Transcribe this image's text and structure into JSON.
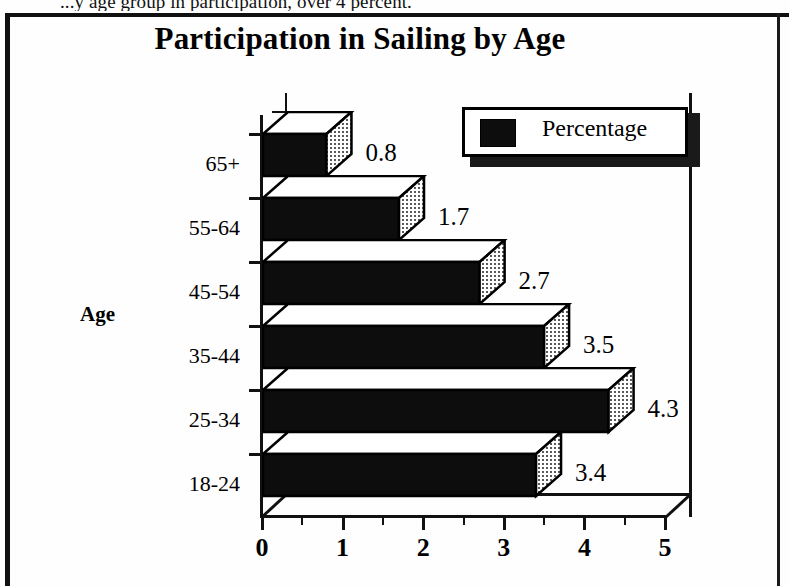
{
  "page": {
    "clipped_header_text": "...y age group in participation, over 4 percent."
  },
  "chart": {
    "title": "Participation in Sailing by Age",
    "y_axis_title": "Age",
    "legend": {
      "entries": [
        {
          "label": "Percentage",
          "color": "#0d0d0d"
        }
      ]
    },
    "x_tick_labels": [
      "0",
      "1",
      "2",
      "3",
      "4",
      "5"
    ],
    "categories": [
      "65+",
      "55-64",
      "45-54",
      "35-44",
      "25-34",
      "18-24"
    ],
    "value_labels": [
      "0.8",
      "1.7",
      "2.7",
      "3.5",
      "4.3",
      "3.4"
    ]
  },
  "chart_data": {
    "type": "bar",
    "orientation": "horizontal",
    "style": "3d",
    "title": "Participation in Sailing by Age",
    "xlabel": "",
    "ylabel": "Age",
    "categories": [
      "65+",
      "55-64",
      "45-54",
      "35-44",
      "25-34",
      "18-24"
    ],
    "values": [
      0.8,
      1.7,
      2.7,
      3.5,
      4.3,
      3.4
    ],
    "series": [
      {
        "name": "Percentage",
        "values": [
          0.8,
          1.7,
          2.7,
          3.5,
          4.3,
          3.4
        ],
        "color": "#0d0d0d"
      }
    ],
    "xlim": [
      0,
      5
    ],
    "x_ticks": [
      0,
      1,
      2,
      3,
      4,
      5
    ],
    "x_minor_ticks": [
      0.5,
      1.5,
      2.5,
      3.5,
      4.5
    ],
    "data_labels": [
      "0.8",
      "1.7",
      "2.7",
      "3.5",
      "4.3",
      "3.4"
    ],
    "grid": false,
    "legend_position": "top-right"
  }
}
